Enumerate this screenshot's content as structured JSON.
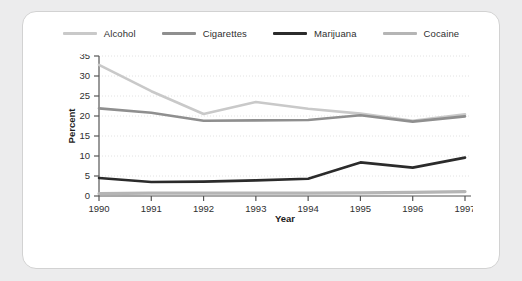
{
  "chart_data": {
    "type": "line",
    "title": "",
    "xlabel": "Year",
    "ylabel": "Percent",
    "categories": [
      "1990",
      "1991",
      "1992",
      "1993",
      "1994",
      "1995",
      "1996",
      "1997"
    ],
    "x": [
      1990,
      1991,
      1992,
      1993,
      1994,
      1995,
      1996,
      1997
    ],
    "ylim": [
      0,
      35
    ],
    "yticks": [
      0,
      5,
      10,
      15,
      20,
      25,
      30,
      35
    ],
    "grid": "horizontal-dotted",
    "legend_position": "top-center",
    "series": [
      {
        "name": "Alcohol",
        "color": "#c9c9c9",
        "values": [
          32.8,
          26.2,
          20.5,
          23.5,
          21.8,
          20.6,
          18.8,
          20.4
        ]
      },
      {
        "name": "Cigarettes",
        "color": "#8f8f8f",
        "values": [
          21.9,
          20.8,
          18.8,
          18.9,
          19.0,
          20.2,
          18.6,
          19.9
        ]
      },
      {
        "name": "Marijuana",
        "color": "#2b2b2b",
        "values": [
          4.5,
          3.5,
          3.6,
          3.9,
          4.3,
          8.4,
          7.1,
          9.6
        ]
      },
      {
        "name": "Cocaine",
        "color": "#b5b5b5",
        "values": [
          0.6,
          0.7,
          0.7,
          0.7,
          0.7,
          0.8,
          0.9,
          1.1
        ]
      }
    ]
  },
  "colors": {
    "page_background": "#ececed",
    "card_background": "#ffffff",
    "card_border": "#d2d2d2",
    "axis": "#555555",
    "gridline": "#e2e2e2",
    "text": "#2f2f2f"
  }
}
